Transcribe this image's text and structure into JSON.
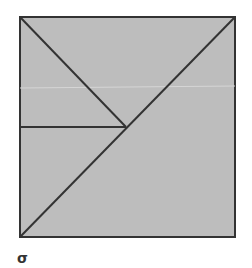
{
  "figure": {
    "label": "σ",
    "square": {
      "x1": 20,
      "y1": 17,
      "x2": 235,
      "y2": 237
    },
    "fill_color": "#bdbdbd",
    "stroke_color": "#333333",
    "center": {
      "x": 126,
      "y": 127
    },
    "lines": [
      {
        "name": "main-diagonal",
        "from": "bottom-left",
        "to": "top-right"
      },
      {
        "name": "half-diagonal",
        "from": "top-left",
        "to": "center"
      },
      {
        "name": "horizontal-segment",
        "from": "left-edge-midpoint",
        "to": "center"
      }
    ]
  }
}
